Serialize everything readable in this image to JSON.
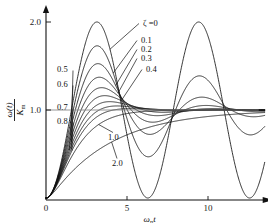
{
  "chart_data": {
    "type": "line",
    "title": "",
    "subtitle": "",
    "xlabel": "ωₙt",
    "ylabel": "ω(t)/Kₘ",
    "xlim": [
      0,
      13.5
    ],
    "ylim": [
      0,
      2.15
    ],
    "xticks": [
      0,
      5,
      10
    ],
    "xticklabels": [
      "0",
      "5",
      "10"
    ],
    "yticks": [
      1.0,
      2.0
    ],
    "yticklabels": [
      "1.0",
      "2.0"
    ],
    "grid": false,
    "legend_position": "inline-annotations",
    "reference_line_y": 1.0,
    "annotations": [
      {
        "text": "ζ =0",
        "damping": 0.0,
        "side": "right"
      },
      {
        "text": "0.1",
        "damping": 0.1,
        "side": "right"
      },
      {
        "text": "0.2",
        "damping": 0.2,
        "side": "right"
      },
      {
        "text": "0.3",
        "damping": 0.3,
        "side": "right"
      },
      {
        "text": "0.4",
        "damping": 0.4,
        "side": "right"
      },
      {
        "text": "0.5",
        "damping": 0.5,
        "side": "left"
      },
      {
        "text": "0.6",
        "damping": 0.6,
        "side": "left"
      },
      {
        "text": "0.7",
        "damping": 0.7,
        "side": "left"
      },
      {
        "text": "0.8",
        "damping": 0.8,
        "side": "left"
      },
      {
        "text": "1.0",
        "damping": 1.0,
        "side": "below"
      },
      {
        "text": "2.0",
        "damping": 2.0,
        "side": "below"
      }
    ],
    "series": [
      {
        "name": "ζ =0",
        "damping": 0.0,
        "peak_value": 2.0,
        "peak_x": 3.14
      },
      {
        "name": "0.1",
        "damping": 0.1,
        "peak_value": 1.73,
        "peak_x": 3.16
      },
      {
        "name": "0.2",
        "damping": 0.2,
        "peak_value": 1.53,
        "peak_x": 3.21
      },
      {
        "name": "0.3",
        "damping": 0.3,
        "peak_value": 1.37,
        "peak_x": 3.29
      },
      {
        "name": "0.4",
        "damping": 0.4,
        "peak_value": 1.25,
        "peak_x": 3.43
      },
      {
        "name": "0.5",
        "damping": 0.5,
        "peak_value": 1.16,
        "peak_x": 3.63
      },
      {
        "name": "0.6",
        "damping": 0.6,
        "peak_value": 1.1,
        "peak_x": 3.93
      },
      {
        "name": "0.7",
        "damping": 0.7,
        "peak_value": 1.05,
        "peak_x": 4.4
      },
      {
        "name": "0.8",
        "damping": 0.8,
        "peak_value": 1.02,
        "peak_x": 5.24
      },
      {
        "name": "1.0",
        "damping": 1.0,
        "peak_value": 1.0,
        "peak_x": 13.5
      },
      {
        "name": "2.0",
        "damping": 2.0,
        "peak_value": 1.0,
        "peak_x": 13.5
      }
    ],
    "formula": "1 - exp(-z*x)*(cos(sqrt(1-z^2)*x) + z/sqrt(1-z^2)*sin(sqrt(1-z^2)*x))"
  },
  "axis": {
    "x_label_omega": "ω",
    "x_label_sub": "n",
    "x_label_t": "t",
    "y_num_omega": "ω",
    "y_num_t": "(t)",
    "y_den_K": "K",
    "y_den_sub": "m"
  }
}
